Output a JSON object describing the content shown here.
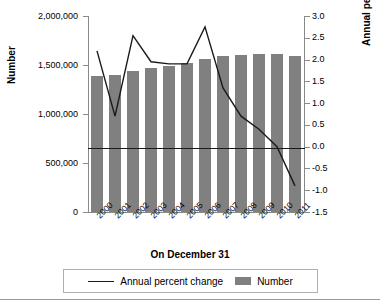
{
  "chart_data": {
    "type": "bar",
    "title": "",
    "xlabel": "On December 31",
    "ylabel": "Number",
    "ylabel_right": "Annual percent change",
    "categories": [
      "2000",
      "2001",
      "2002",
      "2003",
      "2004",
      "2005",
      "2006",
      "2007",
      "2008",
      "2009",
      "2010",
      "2011"
    ],
    "ylim": [
      0,
      2000000
    ],
    "ylim_right": [
      -1.5,
      3.0
    ],
    "yticks": [
      0,
      500000,
      1000000,
      1500000,
      2000000
    ],
    "ytick_labels": [
      "0",
      "500,000",
      "1,000,000",
      "1,500,000",
      "2,000,000"
    ],
    "yticks_right": [
      -1.5,
      -1.0,
      -0.5,
      0.0,
      0.5,
      1.0,
      1.5,
      2.0,
      2.5,
      3.0
    ],
    "ytick_labels_right": [
      "-1.5",
      "-1.0",
      "-0.5",
      "0.0",
      "0.5",
      "1.0",
      "1.5",
      "2.0",
      "2.5",
      "3.0"
    ],
    "grid": false,
    "legend_position": "bottom",
    "zero_reference_line": 0.0,
    "series": [
      {
        "name": "Number",
        "type": "bar",
        "axis": "left",
        "color": "#808080",
        "values": [
          1390000,
          1400000,
          1440000,
          1465000,
          1495000,
          1520000,
          1560000,
          1595000,
          1605000,
          1610000,
          1610000,
          1595000
        ]
      },
      {
        "name": "Annual percent change",
        "type": "line",
        "axis": "right",
        "color": "#1a1a1a",
        "values": [
          2.2,
          0.7,
          2.55,
          1.95,
          1.9,
          1.9,
          2.75,
          1.35,
          0.7,
          0.4,
          0.0,
          -0.9
        ]
      }
    ]
  },
  "legend": {
    "items": [
      {
        "label": "Annual percent change",
        "marker": "line"
      },
      {
        "label": "Number",
        "marker": "swatch"
      }
    ]
  }
}
